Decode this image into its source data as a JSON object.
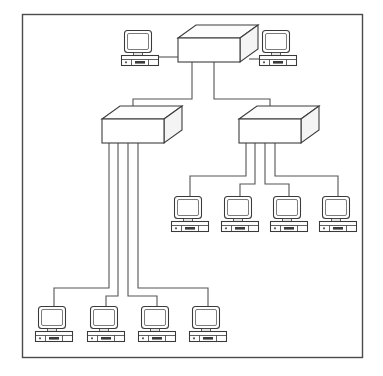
{
  "diagram": {
    "type": "network-topology",
    "background_color": "#ffffff",
    "frame": {
      "label": "diagram border",
      "stroke_color": "#4a4a4a",
      "x": 22,
      "y": 14,
      "width": 340,
      "height": 343
    },
    "link_color": "#555555",
    "device_stroke_color": "#3a3a3a",
    "device_fill_color": "#ffffff",
    "counts": {
      "hubs": 3,
      "computers": 10,
      "links": 12
    },
    "hubs": [
      {
        "id": "hub-root",
        "label": "root hub",
        "tier": "top",
        "x": 178,
        "y": 38,
        "width": 62,
        "height": 24,
        "depth_x": 18,
        "depth_y": 13,
        "ports": 4
      },
      {
        "id": "hub-left",
        "label": "left hub",
        "tier": "middle",
        "x": 102,
        "y": 119,
        "width": 62,
        "height": 24,
        "depth_x": 18,
        "depth_y": 13,
        "ports": 5
      },
      {
        "id": "hub-right",
        "label": "right hub",
        "tier": "middle",
        "x": 239,
        "y": 119,
        "width": 62,
        "height": 24,
        "depth_x": 18,
        "depth_y": 13,
        "ports": 5
      }
    ],
    "computers": [
      {
        "id": "pc-top-left",
        "label": "workstation top left",
        "row": "top",
        "x": 121,
        "y": 30,
        "width": 38,
        "height": 36
      },
      {
        "id": "pc-top-right",
        "label": "workstation top right",
        "row": "top",
        "x": 259,
        "y": 30,
        "width": 38,
        "height": 36
      },
      {
        "id": "pc-mid-1",
        "label": "workstation middle 1",
        "row": "middle",
        "x": 171,
        "y": 196,
        "width": 38,
        "height": 36
      },
      {
        "id": "pc-mid-2",
        "label": "workstation middle 2",
        "row": "middle",
        "x": 221,
        "y": 196,
        "width": 38,
        "height": 36
      },
      {
        "id": "pc-mid-3",
        "label": "workstation middle 3",
        "row": "middle",
        "x": 270,
        "y": 196,
        "width": 38,
        "height": 36
      },
      {
        "id": "pc-mid-4",
        "label": "workstation middle 4",
        "row": "middle",
        "x": 319,
        "y": 196,
        "width": 38,
        "height": 36
      },
      {
        "id": "pc-bot-1",
        "label": "workstation bottom 1",
        "row": "bottom",
        "x": 35,
        "y": 306,
        "width": 38,
        "height": 36
      },
      {
        "id": "pc-bot-2",
        "label": "workstation bottom 2",
        "row": "bottom",
        "x": 87,
        "y": 306,
        "width": 38,
        "height": 36
      },
      {
        "id": "pc-bot-3",
        "label": "workstation bottom 3",
        "row": "bottom",
        "x": 138,
        "y": 306,
        "width": 38,
        "height": 36
      },
      {
        "id": "pc-bot-4",
        "label": "workstation bottom 4",
        "row": "bottom",
        "x": 189,
        "y": 306,
        "width": 38,
        "height": 36
      }
    ],
    "links": [
      {
        "id": "link-root-pc-top-left",
        "from": "pc-top-left",
        "to": "hub-root",
        "style": "horizontal"
      },
      {
        "id": "link-root-pc-top-right",
        "from": "hub-root",
        "to": "pc-top-right",
        "style": "horizontal"
      },
      {
        "id": "link-root-hub-left",
        "from": "hub-root",
        "to": "hub-left",
        "style": "orthogonal"
      },
      {
        "id": "link-root-hub-right",
        "from": "hub-root",
        "to": "hub-right",
        "style": "orthogonal"
      },
      {
        "id": "link-hub-right-pc-mid-1",
        "from": "hub-right",
        "to": "pc-mid-1",
        "style": "orthogonal"
      },
      {
        "id": "link-hub-right-pc-mid-2",
        "from": "hub-right",
        "to": "pc-mid-2",
        "style": "orthogonal"
      },
      {
        "id": "link-hub-right-pc-mid-3",
        "from": "hub-right",
        "to": "pc-mid-3",
        "style": "orthogonal"
      },
      {
        "id": "link-hub-right-pc-mid-4",
        "from": "hub-right",
        "to": "pc-mid-4",
        "style": "orthogonal"
      },
      {
        "id": "link-hub-left-pc-bot-1",
        "from": "hub-left",
        "to": "pc-bot-1",
        "style": "orthogonal"
      },
      {
        "id": "link-hub-left-pc-bot-2",
        "from": "hub-left",
        "to": "pc-bot-2",
        "style": "orthogonal"
      },
      {
        "id": "link-hub-left-pc-bot-3",
        "from": "hub-left",
        "to": "pc-bot-3",
        "style": "orthogonal"
      },
      {
        "id": "link-hub-left-pc-bot-4",
        "from": "hub-left",
        "to": "pc-bot-4",
        "style": "orthogonal"
      }
    ]
  }
}
